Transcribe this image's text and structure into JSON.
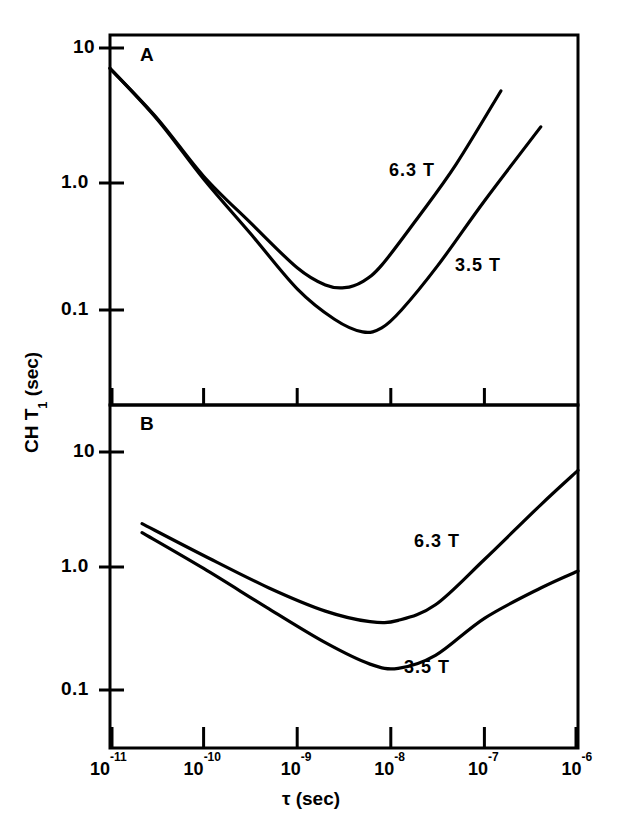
{
  "figure": {
    "y_axis_title": "CH T",
    "y_axis_title_sub": "1",
    "y_axis_title_unit": " (sec)",
    "x_axis_title": "τ (sec)",
    "panels": [
      {
        "id": "A",
        "label": "A"
      },
      {
        "id": "B",
        "label": "B"
      }
    ]
  },
  "ticks": {
    "x": [
      {
        "mantissa": "10",
        "exponent": "-11",
        "value": 1e-11,
        "px": 111
      },
      {
        "mantissa": "10",
        "exponent": "-10",
        "value": 1e-10,
        "px": 195
      },
      {
        "mantissa": "10",
        "exponent": "-9",
        "value": 1e-09,
        "px": 287
      },
      {
        "mantissa": "10",
        "exponent": "-8",
        "value": 1e-08,
        "px": 375
      },
      {
        "mantissa": "10",
        "exponent": "-7",
        "value": 1e-07,
        "px": 468
      },
      {
        "mantissa": "10",
        "exponent": "-6",
        "value": 1e-06,
        "px": 578
      }
    ],
    "panelA_y": [
      {
        "label": "10",
        "value": 10,
        "px": 48
      },
      {
        "label": "1.0",
        "value": 1,
        "px": 183
      },
      {
        "label": "0.1",
        "value": 0.1,
        "px": 310
      }
    ],
    "panelB_y": [
      {
        "label": "10",
        "value": 10,
        "px": 452
      },
      {
        "label": "1.0",
        "value": 1,
        "px": 567
      },
      {
        "label": "0.1",
        "value": 0.1,
        "px": 690
      }
    ]
  },
  "chart_data": {
    "type": "line",
    "title": "",
    "xlabel": "τ (sec)",
    "ylabel": "CH T1 (sec)",
    "xscale": "log",
    "yscale": "log",
    "xlim": [
      1e-11,
      1e-06
    ],
    "grid": false,
    "legend": "inline-annotations",
    "panels": [
      {
        "id": "A",
        "label": "A",
        "ylim": [
          0.035,
          13
        ],
        "series": [
          {
            "name": "6.3 T",
            "annotation": "6.3 T",
            "x": [
              1e-11,
              3.2e-11,
              1e-10,
              3.2e-10,
              1e-09,
              2e-09,
              3.2e-09,
              5e-09,
              8e-09,
              2e-08,
              5e-08,
              1.5e-07
            ],
            "y": [
              7.0,
              2.9,
              1.05,
              0.46,
              0.21,
              0.155,
              0.148,
              0.165,
              0.22,
              0.52,
              1.3,
              4.7
            ]
          },
          {
            "name": "3.5 T",
            "annotation": "3.5 T",
            "x": [
              1e-11,
              3.2e-11,
              1e-10,
              3.2e-10,
              1e-09,
              2.5e-09,
              5e-09,
              8e-09,
              1.3e-08,
              3.2e-08,
              1e-07,
              4e-07
            ],
            "y": [
              7.0,
              2.85,
              1.0,
              0.38,
              0.145,
              0.085,
              0.068,
              0.073,
              0.1,
              0.22,
              0.68,
              2.5
            ]
          }
        ]
      },
      {
        "id": "B",
        "label": "B",
        "ylim": [
          0.035,
          22
        ],
        "series": [
          {
            "name": "6.3 T",
            "annotation": "6.3 T",
            "x": [
              2.2e-11,
              1e-10,
              5e-10,
              2e-09,
              6e-09,
              1.2e-08,
              3e-08,
              1e-07,
              4e-07,
              1e-06
            ],
            "y": [
              2.5,
              1.35,
              0.72,
              0.46,
              0.375,
              0.385,
              0.52,
              1.25,
              3.6,
              7.0
            ]
          },
          {
            "name": "3.5 T",
            "annotation": "3.5 T",
            "x": [
              2.2e-11,
              1e-10,
              5e-10,
              2e-09,
              6e-09,
              1.2e-08,
              3e-08,
              1e-07,
              4e-07,
              1e-06
            ],
            "y": [
              2.1,
              1.05,
              0.48,
              0.25,
              0.165,
              0.152,
              0.195,
              0.4,
              0.72,
              1.0
            ]
          }
        ]
      }
    ]
  }
}
